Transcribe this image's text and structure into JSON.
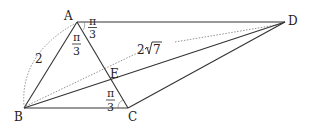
{
  "points": {
    "A": {
      "label": "A",
      "x": 77,
      "y": 22
    },
    "B": {
      "label": "B",
      "x": 24,
      "y": 108
    },
    "C": {
      "label": "C",
      "x": 128,
      "y": 108
    },
    "D": {
      "label": "D",
      "x": 285,
      "y": 22
    },
    "E": {
      "label": "E",
      "x": 110,
      "y": 80
    }
  },
  "segments": [
    "AB",
    "AC",
    "BC",
    "AD",
    "BD",
    "CD"
  ],
  "dotted": [
    "arc AB",
    "BD guide"
  ],
  "labels": {
    "ab_length": "2",
    "bd_length_coef": "2",
    "bd_length_rad": "7",
    "angle_dac_num": "π",
    "angle_dac_den": "3",
    "angle_bac_num": "π",
    "angle_bac_den": "3",
    "angle_bca_num": "π",
    "angle_bca_den": "3"
  }
}
